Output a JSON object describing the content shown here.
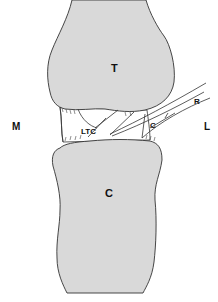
{
  "figure": {
    "labels": {
      "talus": "T",
      "calcaneus": "C",
      "medial": "M",
      "lateral": "L",
      "ltc": "LTC",
      "c_ligament": "C",
      "r_ligament": "R"
    },
    "colors": {
      "bone_fill": "#d9d9d9",
      "outline": "#333333",
      "background": "#ffffff"
    }
  }
}
